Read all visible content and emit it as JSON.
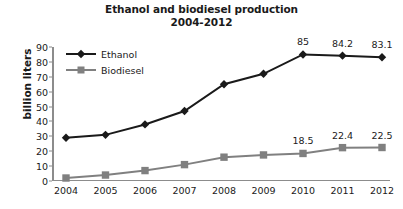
{
  "chart_data": {
    "type": "line",
    "title": "Ethanol and biodiesel production",
    "subtitle": "2004-2012",
    "xlabel": "",
    "ylabel": "billion liters",
    "categories": [
      "2004",
      "2005",
      "2006",
      "2007",
      "2008",
      "2009",
      "2010",
      "2011",
      "2012"
    ],
    "ylim": [
      0,
      90
    ],
    "yticks": [
      "0",
      "10",
      "20",
      "30",
      "40",
      "50",
      "60",
      "70",
      "80",
      "90"
    ],
    "ytick_values": [
      0,
      10,
      20,
      30,
      40,
      50,
      60,
      70,
      80,
      90
    ],
    "grid": false,
    "legend_position": "top-left-inside",
    "series": [
      {
        "name": "Ethanol",
        "color": "#1a1a1a",
        "marker": "diamond",
        "values": [
          29,
          31,
          38,
          47,
          65,
          72,
          85,
          84.2,
          83.1
        ],
        "labels": [
          "",
          "",
          "",
          "",
          "",
          "",
          "85",
          "84.2",
          "83.1"
        ]
      },
      {
        "name": "Biodiesel",
        "color": "#808080",
        "marker": "square",
        "values": [
          2,
          4,
          7,
          11,
          16,
          17.5,
          18.5,
          22.4,
          22.5
        ],
        "labels": [
          "",
          "",
          "",
          "",
          "",
          "",
          "18.5",
          "22.4",
          "22.5"
        ]
      }
    ]
  }
}
